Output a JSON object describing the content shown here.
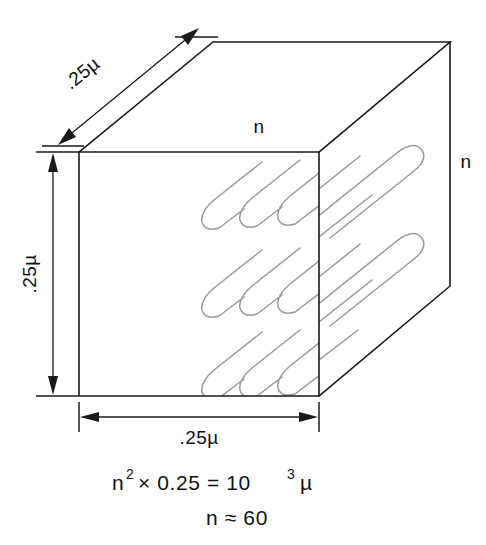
{
  "figure": {
    "background_color": "#ffffff",
    "edge_color": "#1a1a1a",
    "serpentine_color": "#9a9a9a"
  },
  "labels": {
    "depth_dimension": ".25µ",
    "height_dimension": ".25µ",
    "width_dimension": ".25µ",
    "top_face_label": "n",
    "right_face_label": "n"
  },
  "equation": {
    "line1_base": "n",
    "line1_exponent": "2",
    "line1_rest": "×  0.25  =  10",
    "line1_exponent2": "3",
    "line1_unit": "µ",
    "line2": "n  ≈   60"
  },
  "geometry": {
    "front_face": {
      "left": 79,
      "top": 152,
      "right": 319,
      "bottom": 396
    },
    "depth_vector": {
      "dx": 131,
      "dy": -110
    },
    "serpentine_rows": 3,
    "hairpins_per_row": 3
  }
}
